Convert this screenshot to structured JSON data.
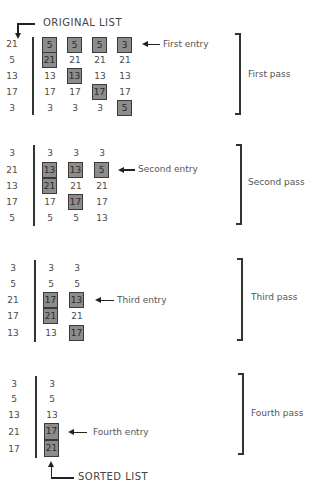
{
  "captions": {
    "original_list": "ORIGINAL LIST",
    "sorted_list": "SORTED LIST"
  },
  "passes": [
    {
      "label": "First pass",
      "entry_label": "First entry",
      "original": [
        "21",
        "5",
        "13",
        "17",
        "3"
      ],
      "columns": [
        [
          "5",
          "21",
          "13",
          "17",
          "3"
        ],
        [
          "5",
          "21",
          "13",
          "17",
          "3"
        ],
        [
          "5",
          "21",
          "13",
          "17",
          "3"
        ],
        [
          "3",
          "21",
          "13",
          "17",
          "5"
        ]
      ],
      "highlighted": [
        [
          0,
          1
        ],
        [
          0,
          2
        ],
        [
          0,
          3
        ],
        [
          0,
          4
        ]
      ]
    },
    {
      "label": "Second pass",
      "entry_label": "Second entry",
      "original": [
        "3",
        "21",
        "13",
        "17",
        "5"
      ],
      "columns": [
        [
          "3",
          "13",
          "21",
          "17",
          "5"
        ],
        [
          "3",
          "13",
          "21",
          "17",
          "5"
        ],
        [
          "3",
          "5",
          "21",
          "17",
          "13"
        ]
      ],
      "highlighted": [
        [
          1,
          2
        ],
        [
          1,
          3
        ],
        [
          1,
          4
        ]
      ]
    },
    {
      "label": "Third pass",
      "entry_label": "Third entry",
      "original": [
        "3",
        "5",
        "21",
        "17",
        "13"
      ],
      "columns": [
        [
          "3",
          "5",
          "17",
          "21",
          "13"
        ],
        [
          "3",
          "5",
          "13",
          "21",
          "17"
        ]
      ],
      "highlighted": [
        [
          2,
          3
        ],
        [
          2,
          4
        ]
      ]
    },
    {
      "label": "Fourth pass",
      "entry_label": "Fourth entry",
      "original": [
        "3",
        "5",
        "13",
        "21",
        "17"
      ],
      "columns": [
        [
          "3",
          "5",
          "13",
          "17",
          "21"
        ]
      ],
      "highlighted": [
        [
          3,
          4
        ]
      ]
    }
  ],
  "colors": {
    "box_fill": "#8c8c8c",
    "box_border": "#3a3a3a",
    "line": "#222222",
    "text": "#4a4a4a"
  }
}
